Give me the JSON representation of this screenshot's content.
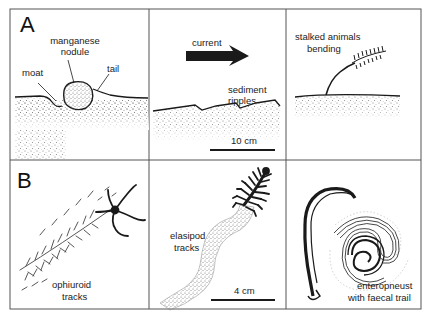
{
  "figure": {
    "panels": {
      "A": {
        "letter": "A",
        "subpanels": [
          {
            "id": "nodule",
            "labels": {
              "manganese_line1": "manganese",
              "manganese_line2": "nodule",
              "moat": "moat",
              "tail": "tail"
            }
          },
          {
            "id": "current",
            "labels": {
              "current": "current",
              "ripples_line1": "sediment",
              "ripples_line2": "ripples",
              "scale": "10 cm"
            }
          },
          {
            "id": "stalked",
            "labels": {
              "line1": "stalked animals",
              "line2": "bending"
            }
          }
        ]
      },
      "B": {
        "letter": "B",
        "subpanels": [
          {
            "id": "ophiuroid",
            "labels": {
              "line1": "ophiuroid",
              "line2": "tracks"
            }
          },
          {
            "id": "elasipod",
            "labels": {
              "line1": "elasipod",
              "line2": "tracks",
              "scale": "4 cm"
            }
          },
          {
            "id": "enteropneust",
            "labels": {
              "line1": "enteropneust",
              "line2": "with faecal trail"
            }
          }
        ]
      }
    },
    "colors": {
      "ink": "#1a1a1a",
      "border": "#555555",
      "stipple": "#9a9a9a",
      "background": "#ffffff"
    }
  }
}
